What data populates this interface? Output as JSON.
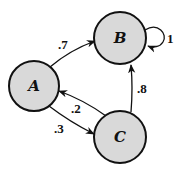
{
  "diagram": {
    "type": "markov-chain",
    "nodes": [
      {
        "id": "A",
        "label": "A",
        "cx": 34,
        "cy": 86,
        "r": 25
      },
      {
        "id": "B",
        "label": "B",
        "cx": 120,
        "cy": 38,
        "r": 26
      },
      {
        "id": "C",
        "label": "C",
        "cx": 120,
        "cy": 137,
        "r": 26
      }
    ],
    "edges": [
      {
        "from": "A",
        "to": "B",
        "label": ".7"
      },
      {
        "from": "B",
        "to": "B",
        "label": "1"
      },
      {
        "from": "C",
        "to": "A",
        "label": ".2"
      },
      {
        "from": "A",
        "to": "C",
        "label": ".3"
      },
      {
        "from": "C",
        "to": "B",
        "label": ".8"
      }
    ],
    "colors": {
      "node_fill": "#d9d9d9",
      "stroke": "#111111",
      "background": "#ffffff"
    }
  }
}
